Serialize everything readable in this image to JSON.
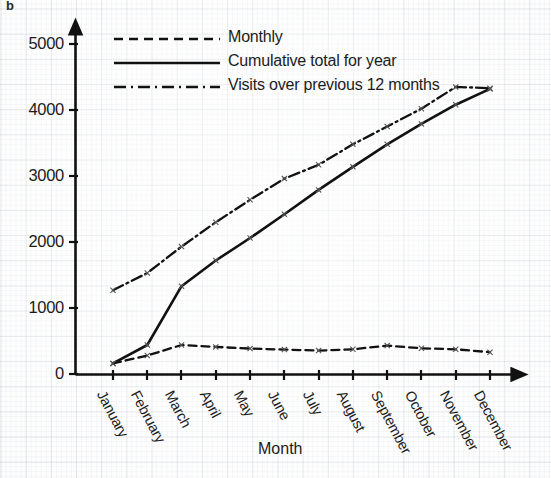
{
  "figure": {
    "panel_label": "b"
  },
  "chart_data": {
    "type": "line",
    "title": "",
    "subtitle": "",
    "xlabel": "Month",
    "ylabel": "",
    "grid": true,
    "grid_style": "graph-paper",
    "legend_position": "top-left-inside",
    "xlim": [
      0,
      13
    ],
    "ylim": [
      0,
      5400
    ],
    "yticks": [
      0,
      1000,
      2000,
      3000,
      4000,
      5000
    ],
    "ytick_labels": [
      "0",
      "1000",
      "2000",
      "3000",
      "4000",
      "5000"
    ],
    "categories": [
      "January",
      "February",
      "March",
      "April",
      "May",
      "June",
      "July",
      "August",
      "September",
      "October",
      "November",
      "December"
    ],
    "series": [
      {
        "name": "Monthly",
        "line_style": "dashed",
        "color": "#111111",
        "values": [
          160,
          280,
          440,
          410,
          385,
          370,
          355,
          375,
          430,
          390,
          375,
          330
        ]
      },
      {
        "name": "Cumulative total for year",
        "line_style": "solid",
        "color": "#111111",
        "values": [
          160,
          440,
          1330,
          1720,
          2060,
          2420,
          2790,
          3140,
          3480,
          3790,
          4080,
          4320
        ]
      },
      {
        "name": "Visits over previous 12 months",
        "line_style": "dash-dot",
        "color": "#111111",
        "values": [
          1270,
          1530,
          1930,
          2300,
          2640,
          2960,
          3170,
          3480,
          3750,
          4020,
          4350,
          4330
        ]
      }
    ]
  },
  "legend": {
    "items": [
      {
        "label": "Monthly",
        "style": "dashed"
      },
      {
        "label": "Cumulative total for year",
        "style": "solid"
      },
      {
        "label": "Visits over previous 12 months",
        "style": "dash-dot"
      }
    ]
  },
  "axes": {
    "x_axis_title": "Month",
    "y_axis_title": ""
  }
}
